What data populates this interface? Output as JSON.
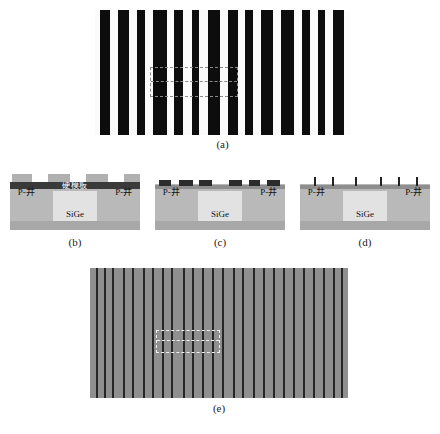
{
  "figure": {
    "panels": [
      {
        "id": "a",
        "caption": "(a)"
      },
      {
        "id": "b",
        "caption": "(b)"
      },
      {
        "id": "c",
        "caption": "(c)"
      },
      {
        "id": "d",
        "caption": "(d)"
      },
      {
        "id": "e",
        "caption": "(e)"
      }
    ]
  },
  "panel_a": {
    "caption": "(a)",
    "description": "top-down striped pattern",
    "background_color": "#fbfbfb",
    "stripe_color": "#0d0d0d",
    "stripes": [
      {
        "left": 5,
        "width": 10
      },
      {
        "left": 23,
        "width": 11
      },
      {
        "left": 42,
        "width": 8
      },
      {
        "left": 58,
        "width": 14
      },
      {
        "left": 79,
        "width": 9
      },
      {
        "left": 97,
        "width": 7
      },
      {
        "left": 113,
        "width": 12
      },
      {
        "left": 133,
        "width": 10
      },
      {
        "left": 150,
        "width": 8
      },
      {
        "left": 166,
        "width": 12
      },
      {
        "left": 186,
        "width": 13
      },
      {
        "left": 207,
        "width": 8
      },
      {
        "left": 223,
        "width": 7
      },
      {
        "left": 238,
        "width": 11
      }
    ],
    "highlight_box": {
      "label": "region-of-interest"
    }
  },
  "panel_b": {
    "caption": "(b)",
    "hardmask_label": "硬模板",
    "well_left_label": "P-井",
    "well_right_label": "P-井",
    "sige_label": "SiGe",
    "resist_blocks": [
      {
        "left": 2,
        "width": 20
      },
      {
        "left": 38,
        "width": 22
      },
      {
        "left": 76,
        "width": 22
      },
      {
        "left": 114,
        "width": 16
      }
    ],
    "colors": {
      "substrate": "#b9b9b9",
      "substrate_bottom": "#a8a8a8",
      "sige": "#e2e2e2",
      "hardmask": "#3a3a3a",
      "resist": "#b0b0b0"
    }
  },
  "panel_c": {
    "caption": "(c)",
    "well_left_label": "P-井",
    "well_right_label": "P-井",
    "sige_label": "SiGe",
    "pattern_blocks": [
      {
        "left": 4,
        "width": 12
      },
      {
        "left": 24,
        "width": 14
      },
      {
        "left": 44,
        "width": 13
      },
      {
        "left": 74,
        "width": 13
      },
      {
        "left": 94,
        "width": 11
      },
      {
        "left": 112,
        "width": 13
      }
    ],
    "colors": {
      "film": "#8e8e8e",
      "block": "#2b2b2b"
    }
  },
  "panel_d": {
    "caption": "(d)",
    "well_left_label": "P-井",
    "well_right_label": "P-井",
    "sige_label": "SiGe",
    "pillars": [
      {
        "left": 14
      },
      {
        "left": 32
      },
      {
        "left": 55
      },
      {
        "left": 80
      },
      {
        "left": 98
      },
      {
        "left": 116
      }
    ],
    "colors": {
      "film": "#8e8e8e",
      "pillar": "#222222"
    }
  },
  "panel_e": {
    "caption": "(e)",
    "description": "top-down gray striped pattern",
    "background_color": "#8f8f8f",
    "stripe_color": "#262626",
    "stripes": [
      {
        "left": 6
      },
      {
        "left": 14
      },
      {
        "left": 22
      },
      {
        "left": 33
      },
      {
        "left": 42
      },
      {
        "left": 53
      },
      {
        "left": 62
      },
      {
        "left": 72
      },
      {
        "left": 81
      },
      {
        "left": 93
      },
      {
        "left": 102
      },
      {
        "left": 112
      },
      {
        "left": 122
      },
      {
        "left": 132
      },
      {
        "left": 143
      },
      {
        "left": 152
      },
      {
        "left": 163
      },
      {
        "left": 173
      },
      {
        "left": 183
      },
      {
        "left": 193
      },
      {
        "left": 203
      },
      {
        "left": 213
      },
      {
        "left": 223
      },
      {
        "left": 233
      },
      {
        "left": 243
      },
      {
        "left": 251
      }
    ],
    "highlight_box": {
      "label": "region-of-interest"
    }
  }
}
